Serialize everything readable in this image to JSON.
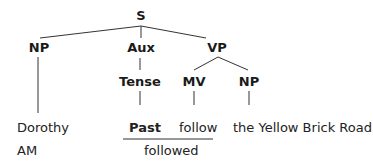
{
  "diagram": {
    "type": "syntax-tree",
    "nodes": {
      "root": "S",
      "np_subject": "NP",
      "aux": "Aux",
      "vp": "VP",
      "tense": "Tense",
      "mv": "MV",
      "np_object": "NP"
    },
    "terminals": {
      "subject": "Dorothy",
      "tense": "Past",
      "verb": "follow",
      "object": "the Yellow Brick Road"
    },
    "bottom_row": {
      "label": "AM",
      "surface_verb": "followed"
    },
    "edges": [
      [
        "S",
        "NP"
      ],
      [
        "S",
        "Aux"
      ],
      [
        "S",
        "VP"
      ],
      [
        "Aux",
        "Tense"
      ],
      [
        "VP",
        "MV"
      ],
      [
        "VP",
        "NP"
      ],
      [
        "NP",
        "Dorothy"
      ],
      [
        "Tense",
        "Past"
      ],
      [
        "MV",
        "follow"
      ],
      [
        "NP",
        "the Yellow Brick Road"
      ]
    ],
    "line_color": "#333333"
  }
}
